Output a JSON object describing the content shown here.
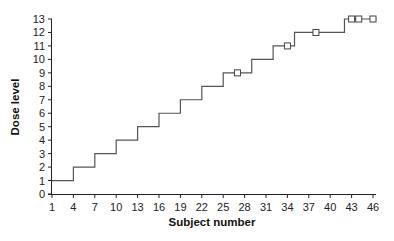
{
  "chart_data": {
    "type": "line",
    "subtype": "step",
    "title": "",
    "xlabel": "Subject number",
    "ylabel": "Dose level",
    "xlim": [
      1,
      46
    ],
    "ylim": [
      0,
      13
    ],
    "x_ticks": [
      1,
      4,
      7,
      10,
      13,
      16,
      19,
      22,
      25,
      28,
      31,
      34,
      37,
      40,
      43,
      46
    ],
    "y_ticks": [
      0,
      1,
      2,
      3,
      4,
      5,
      6,
      7,
      8,
      9,
      10,
      11,
      12,
      13
    ],
    "grid": false,
    "legend": null,
    "series": [
      {
        "name": "Dose level",
        "style": "step",
        "steps": [
          {
            "from": 1,
            "to": 4,
            "dose": 1
          },
          {
            "from": 4,
            "to": 7,
            "dose": 2
          },
          {
            "from": 7,
            "to": 10,
            "dose": 3
          },
          {
            "from": 10,
            "to": 13,
            "dose": 4
          },
          {
            "from": 13,
            "to": 16,
            "dose": 5
          },
          {
            "from": 16,
            "to": 19,
            "dose": 6
          },
          {
            "from": 19,
            "to": 22,
            "dose": 7
          },
          {
            "from": 22,
            "to": 25,
            "dose": 8
          },
          {
            "from": 25,
            "to": 29,
            "dose": 9
          },
          {
            "from": 29,
            "to": 32,
            "dose": 10
          },
          {
            "from": 32,
            "to": 35,
            "dose": 11
          },
          {
            "from": 35,
            "to": 42,
            "dose": 12
          },
          {
            "from": 42,
            "to": 46.5,
            "dose": 13
          }
        ]
      },
      {
        "name": "Square markers",
        "style": "marker-square",
        "points": [
          {
            "x": 27,
            "y": 9
          },
          {
            "x": 34,
            "y": 11
          },
          {
            "x": 38,
            "y": 12
          },
          {
            "x": 43,
            "y": 13
          },
          {
            "x": 44,
            "y": 13
          },
          {
            "x": 46,
            "y": 13
          }
        ]
      }
    ],
    "colors": {
      "line": "#555555",
      "axis": "#222222",
      "marker": "#444444"
    }
  }
}
